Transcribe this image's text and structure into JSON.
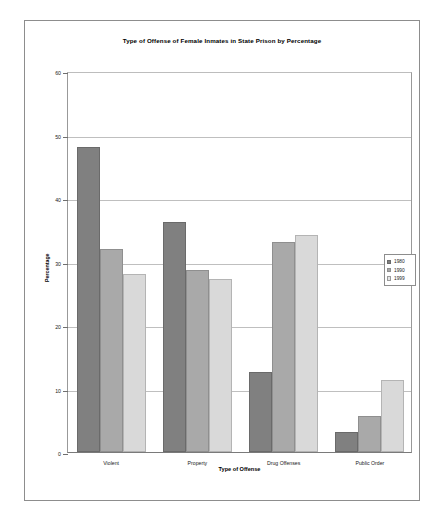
{
  "chart_data": {
    "type": "bar",
    "title": "Type of Offense of Female Inmates in State Prison by Percentage",
    "xlabel": "Type of Offense",
    "ylabel": "Percentage",
    "categories": [
      "Violent",
      "Property",
      "Drug Offenses",
      "Public Order"
    ],
    "series": [
      {
        "name": "1980",
        "color": "#808080",
        "values": [
          48.0,
          36.3,
          12.6,
          3.1
        ]
      },
      {
        "name": "1990",
        "color": "#a9a9a9",
        "values": [
          32.0,
          28.6,
          33.0,
          5.7
        ]
      },
      {
        "name": "1999",
        "color": "#d9d9d9",
        "values": [
          28.0,
          27.2,
          34.2,
          11.4
        ]
      }
    ],
    "ylim": [
      0,
      60
    ],
    "yticks": [
      0,
      10,
      20,
      30,
      40,
      50,
      60
    ],
    "ytick_labels": [
      "0",
      "10",
      "20",
      "30",
      "40",
      "50",
      "60"
    ],
    "grid": "horizontal",
    "legend_position": "right-middle"
  },
  "clipped_caption": ""
}
